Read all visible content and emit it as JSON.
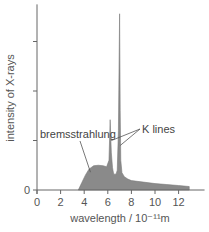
{
  "chart_data": {
    "type": "area",
    "title": "",
    "xlabel": "wavelength / 10⁻¹¹m",
    "ylabel": "intensity of X-rays",
    "xlim": [
      0,
      14.2
    ],
    "ylim": [
      0,
      3.75
    ],
    "x_ticks": [
      0,
      2,
      4,
      6,
      8,
      10,
      12
    ],
    "x_tick_labels": [
      "0",
      "2",
      "4",
      "6",
      "8",
      "10",
      "12"
    ],
    "y_ticks": [
      0,
      1,
      2,
      3
    ],
    "y_tick_labels": [
      "0",
      "",
      "",
      ""
    ],
    "grid": false,
    "fill_color": "#8a8a8a",
    "axis_color": "#666666",
    "series": [
      {
        "name": "spectrum",
        "x": [
          3.5,
          3.8,
          4.1,
          4.4,
          4.8,
          5.2,
          5.6,
          5.9,
          6.1,
          6.2,
          6.3,
          6.4,
          6.5,
          6.7,
          6.8,
          6.9,
          7.0,
          7.05,
          7.1,
          7.2,
          7.4,
          7.7,
          8.0,
          9.0,
          10.0,
          11.0,
          12.0,
          12.9
        ],
        "y": [
          0.0,
          0.15,
          0.3,
          0.42,
          0.49,
          0.5,
          0.49,
          0.47,
          0.6,
          1.42,
          0.75,
          0.45,
          0.32,
          0.32,
          0.4,
          1.2,
          3.56,
          1.6,
          0.6,
          0.35,
          0.27,
          0.22,
          0.19,
          0.16,
          0.13,
          0.11,
          0.09,
          0.07
        ]
      }
    ],
    "annotations": [
      {
        "text": "bremsstrahlung",
        "points_to": [
          4.7,
          0.4
        ]
      },
      {
        "text": "K lines",
        "points_to": [
          [
            6.3,
            1.1
          ],
          [
            7.05,
            1.0
          ]
        ]
      }
    ]
  }
}
